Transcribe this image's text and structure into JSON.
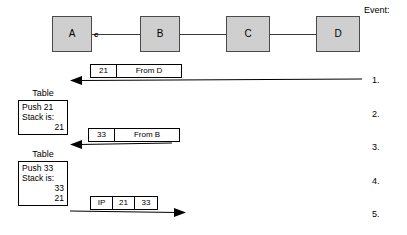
{
  "header": {
    "event_label": "Event:"
  },
  "network": {
    "nodes": [
      {
        "label": "A",
        "x": 52,
        "y": 16,
        "w": 40,
        "h": 36
      },
      {
        "label": "B",
        "x": 140,
        "y": 16,
        "w": 40,
        "h": 36
      },
      {
        "label": "C",
        "x": 226,
        "y": 16,
        "w": 44,
        "h": 36
      },
      {
        "label": "D",
        "x": 316,
        "y": 16,
        "w": 44,
        "h": 36
      }
    ],
    "port_label": "c",
    "fill_color": "#cfcfcf",
    "border_color": "#4a4a4a"
  },
  "packets": [
    {
      "id": "packet-1",
      "cells": [
        {
          "text": "21",
          "width": 26
        },
        {
          "text": "From D",
          "width": 64
        }
      ],
      "x": 90,
      "y": 64
    },
    {
      "id": "packet-2",
      "cells": [
        {
          "text": "33",
          "width": 26
        },
        {
          "text": "From B",
          "width": 64
        }
      ],
      "x": 88,
      "y": 128
    },
    {
      "id": "packet-3",
      "cells": [
        {
          "text": "IP",
          "width": 22
        },
        {
          "text": "21",
          "width": 22
        },
        {
          "text": "33",
          "width": 22
        }
      ],
      "x": 90,
      "y": 196
    }
  ],
  "arrows": [
    {
      "id": "arrow-1",
      "direction": "left",
      "x": 70,
      "y": 80,
      "length": 292
    },
    {
      "id": "arrow-2",
      "direction": "left",
      "x": 70,
      "y": 144,
      "length": 102
    },
    {
      "id": "arrow-3",
      "direction": "right",
      "x": 70,
      "y": 212,
      "length": 116
    }
  ],
  "tables": [
    {
      "id": "table-1",
      "caption": "Table",
      "x": 18,
      "y": 89,
      "width": 50,
      "lines": [
        {
          "text": "Push 21",
          "align": "left"
        },
        {
          "text": "Stack is:",
          "align": "left"
        },
        {
          "text": "21",
          "align": "right"
        }
      ]
    },
    {
      "id": "table-2",
      "caption": "Table",
      "x": 18,
      "y": 150,
      "width": 50,
      "lines": [
        {
          "text": "Push 33",
          "align": "left"
        },
        {
          "text": "Stack is:",
          "align": "left"
        },
        {
          "text": "33",
          "align": "right"
        },
        {
          "text": "21",
          "align": "right"
        }
      ]
    }
  ],
  "events": [
    {
      "label": "1.",
      "y": 76
    },
    {
      "label": "2.",
      "y": 110
    },
    {
      "label": "3.",
      "y": 143
    },
    {
      "label": "4.",
      "y": 177
    },
    {
      "label": "5.",
      "y": 210
    }
  ]
}
